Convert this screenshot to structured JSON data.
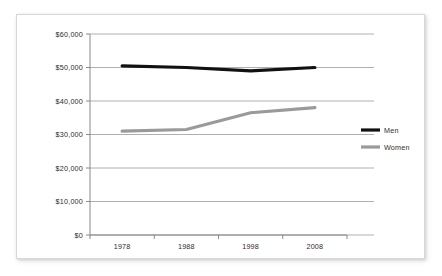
{
  "chart_data": {
    "type": "line",
    "title": "",
    "subtitle": "",
    "xlabel": "",
    "ylabel": "",
    "categories": [
      "1978",
      "1988",
      "1998",
      "2008"
    ],
    "series": [
      {
        "name": "Men",
        "values": [
          50500,
          50000,
          49000,
          50000
        ],
        "color": "#111111"
      },
      {
        "name": "Women",
        "values": [
          31000,
          31500,
          36500,
          38000
        ],
        "color": "#9a9a9a"
      }
    ],
    "ylim": [
      0,
      60000
    ],
    "ytick_values": [
      0,
      10000,
      20000,
      30000,
      40000,
      50000,
      60000
    ],
    "ytick_labels": [
      "$0",
      "$10,000",
      "$20,000",
      "$30,000",
      "$40,000",
      "$50,000",
      "$60,000"
    ],
    "xtick_labels": [
      "1978",
      "1988",
      "1998",
      "2008"
    ],
    "grid": "horizontal",
    "legend_position": "right",
    "legend_entries": [
      {
        "label": "Men",
        "color": "#111111"
      },
      {
        "label": "Women",
        "color": "#9a9a9a"
      }
    ]
  },
  "style": {
    "grid_color": "#9c9c9c",
    "axis_color": "#7d7d7d",
    "text_color": "#2b2b2b",
    "background": "#ffffff",
    "card_border": "#d8d8d8"
  }
}
